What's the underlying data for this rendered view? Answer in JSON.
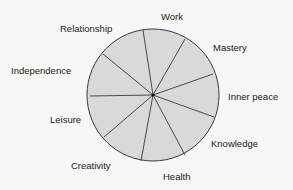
{
  "diagram": {
    "type": "wheel",
    "center": [
      153,
      95
    ],
    "radius": 66,
    "fill": "#d9d9d9",
    "stroke": "#3a3a3a",
    "segments": [
      {
        "label": "Work",
        "x": 161,
        "y": 12
      },
      {
        "label": "Mastery",
        "x": 213,
        "y": 43
      },
      {
        "label": "Inner peace",
        "x": 228,
        "y": 92
      },
      {
        "label": "Knowledge",
        "x": 211,
        "y": 139
      },
      {
        "label": "Health",
        "x": 163,
        "y": 172
      },
      {
        "label": "Creativity",
        "x": 71,
        "y": 161
      },
      {
        "label": "Leisure",
        "x": 50,
        "y": 115
      },
      {
        "label": "Independence",
        "x": 11,
        "y": 66
      },
      {
        "label": "Relationship",
        "x": 60,
        "y": 24
      }
    ],
    "boundaries": [
      [
        143,
        30
      ],
      [
        185,
        39
      ],
      [
        213,
        74
      ],
      [
        214,
        117
      ],
      [
        185,
        155
      ],
      [
        141,
        161
      ],
      [
        104,
        137
      ],
      [
        90,
        96
      ],
      [
        103,
        54
      ]
    ]
  }
}
